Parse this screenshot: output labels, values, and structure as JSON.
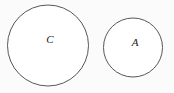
{
  "diagram": {
    "type": "set-diagram",
    "background_color": "#fbfbfb",
    "stroke_color": "#575757",
    "fill_color": "#ffffff",
    "label_color": "#1a1a1a",
    "canvas": {
      "width": 174,
      "height": 93
    },
    "shapes": [
      {
        "id": "circle-c",
        "shape": "circle",
        "label": "C",
        "cx": 48,
        "cy": 45.5,
        "r": 40.5,
        "label_x": 50,
        "label_y": 40
      },
      {
        "id": "circle-a",
        "shape": "circle",
        "label": "A",
        "cx": 133,
        "cy": 47.5,
        "r": 29.5,
        "label_x": 135,
        "label_y": 43
      }
    ]
  }
}
